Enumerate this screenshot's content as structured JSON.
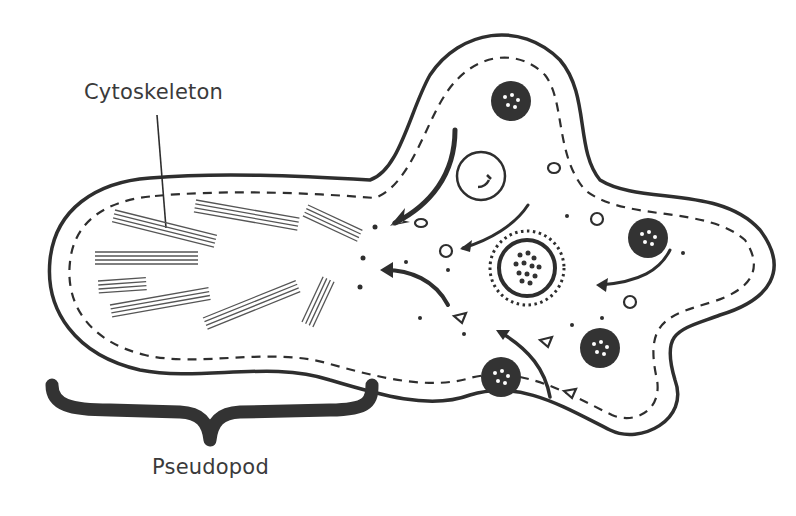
{
  "diagram": {
    "labels": {
      "cytoskeleton": "Cytoskeleton",
      "pseudopod": "Pseudopod"
    },
    "colors": {
      "ink": "#2e2e2e",
      "fill": "#ffffff",
      "organelle": "#333333"
    },
    "elements": [
      "cell-membrane",
      "inner-dashed-boundary",
      "cytoskeleton-filament-bundles",
      "nucleus",
      "contractile-vacuole",
      "food-vacuoles",
      "cytoplasm-flow-arrows",
      "granules",
      "pseudopod-brace"
    ]
  }
}
